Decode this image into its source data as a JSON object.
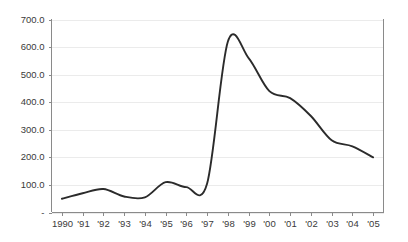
{
  "chart_data": {
    "type": "line",
    "title": "",
    "subtitle": "",
    "xlabel": "",
    "ylabel": "",
    "grid": true,
    "legend": false,
    "legend_position": "none",
    "smoothed": true,
    "line_color": "#2b2b2b",
    "grid_color": "#ebebeb",
    "axis_color": "#8a8a8a",
    "background_color": "#ffffff",
    "xlim": [
      1990,
      2005
    ],
    "ylim": [
      0,
      700
    ],
    "y_tick_step": 100,
    "categories": [
      "1990",
      "'91",
      "'92",
      "'93",
      "'94",
      "'95",
      "'96",
      "'97",
      "'98",
      "'99",
      "'00",
      "'01",
      "'02",
      "'03",
      "'04",
      "'05"
    ],
    "x_tick_labels": [
      "1990",
      "'91",
      "'92",
      "'93",
      "'94",
      "'95",
      "'96",
      "'97",
      "'98",
      "'99",
      "'00",
      "'01",
      "'02",
      "'03",
      "'04",
      "'05"
    ],
    "y_tick_labels": [
      "700.0",
      "600.0",
      "500.0",
      "400.0",
      "300.0",
      "200.0",
      "100.0",
      "-"
    ],
    "y_tick_values": [
      700,
      600,
      500,
      400,
      300,
      200,
      100,
      0
    ],
    "values": [
      50,
      70,
      85,
      58,
      55,
      110,
      92,
      105,
      620,
      560,
      440,
      415,
      350,
      262,
      240,
      200
    ],
    "series": [
      {
        "name": "series-1",
        "values": [
          50,
          70,
          85,
          58,
          55,
          110,
          92,
          105,
          620,
          560,
          440,
          415,
          350,
          262,
          240,
          200
        ]
      }
    ]
  }
}
